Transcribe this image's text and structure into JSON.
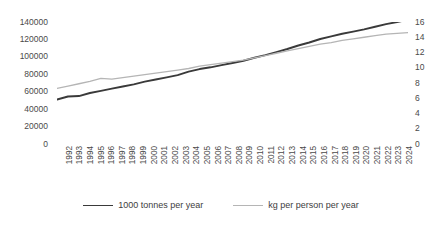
{
  "chart_data": {
    "type": "line",
    "title": "",
    "xlabel": "",
    "ylabel": "",
    "grid": false,
    "legend_position": "bottom",
    "x": [
      1992,
      1993,
      1994,
      1995,
      1996,
      1997,
      1998,
      1999,
      2000,
      2001,
      2002,
      2003,
      2004,
      2005,
      2006,
      2007,
      2008,
      2009,
      2010,
      2011,
      2012,
      2013,
      2014,
      2015,
      2016,
      2017,
      2018,
      2019,
      2020,
      2021,
      2022,
      2023,
      2024
    ],
    "xtick_labels": [
      "1992",
      "1993",
      "1994",
      "1995",
      "1996",
      "1997",
      "1998",
      "1999",
      "2000",
      "2001",
      "2002",
      "2003",
      "2004",
      "2005",
      "2006",
      "2007",
      "2008",
      "2009",
      "2010",
      "2011",
      "2012",
      "2013",
      "2014",
      "2015",
      "2016",
      "2017",
      "2018",
      "2019",
      "2020",
      "2021",
      "2022",
      "2023",
      "2024"
    ],
    "axes": {
      "left": {
        "ylim": [
          0,
          140000
        ],
        "ticks": [
          0,
          20000,
          40000,
          60000,
          80000,
          100000,
          120000,
          140000
        ],
        "tick_labels": [
          "0",
          "20000",
          "40000",
          "60000",
          "80000",
          "100000",
          "120000",
          "140000"
        ]
      },
      "right": {
        "ylim": [
          0,
          16
        ],
        "ticks": [
          0,
          2,
          4,
          6,
          8,
          10,
          12,
          14,
          16
        ],
        "tick_labels": [
          "0",
          "2",
          "4",
          "6",
          "8",
          "10",
          "12",
          "14",
          "16"
        ]
      }
    },
    "series": [
      {
        "name": "1000 tonnes per year",
        "axis": "left",
        "color": "#3a3a3a",
        "width": 1.9,
        "values": [
          51000,
          54500,
          55000,
          58500,
          61000,
          63500,
          66000,
          68500,
          71500,
          74000,
          76500,
          79000,
          83000,
          86000,
          88000,
          90500,
          93000,
          95500,
          99000,
          102000,
          105500,
          109000,
          113000,
          116500,
          120500,
          123500,
          126500,
          129000,
          131500,
          134500,
          137500,
          140000,
          142500
        ]
      },
      {
        "name": "kg per person per year",
        "axis": "right",
        "color": "#b5b5b5",
        "width": 1.3,
        "values": [
          7.3,
          7.6,
          7.9,
          8.2,
          8.6,
          8.5,
          8.7,
          8.9,
          9.1,
          9.3,
          9.5,
          9.7,
          9.9,
          10.2,
          10.4,
          10.6,
          10.8,
          11.0,
          11.3,
          11.6,
          11.9,
          12.2,
          12.5,
          12.8,
          13.1,
          13.3,
          13.6,
          13.8,
          14.0,
          14.2,
          14.4,
          14.5,
          14.6
        ]
      }
    ]
  },
  "legend": {
    "items": [
      {
        "label": "1000 tonnes per year",
        "color": "#3a3a3a",
        "width": 1.9
      },
      {
        "label": "kg per person per year",
        "color": "#b5b5b5",
        "width": 1.3
      }
    ]
  }
}
